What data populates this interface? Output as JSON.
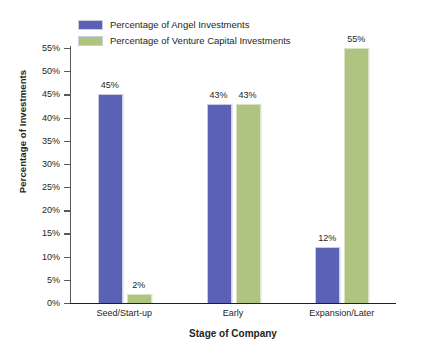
{
  "chart_data": {
    "type": "bar",
    "title": "",
    "xlabel": "Stage of Company",
    "ylabel": "Percentage of Investments",
    "categories": [
      "Seed/Start-up",
      "Early",
      "Expansion/Later"
    ],
    "series": [
      {
        "name": "Percentage of Angel Investments",
        "color": "#5B62B5",
        "values": [
          45,
          43,
          12
        ],
        "labels": [
          "45%",
          "43%",
          "12%"
        ]
      },
      {
        "name": "Percentage of Venture Capital Investments",
        "color": "#AFC480",
        "values": [
          2,
          43,
          55
        ],
        "labels": [
          "2%",
          "43%",
          "55%"
        ]
      }
    ],
    "ylim": [
      0,
      55
    ],
    "ytick_values": [
      0,
      5,
      10,
      15,
      20,
      25,
      30,
      35,
      40,
      45,
      50,
      55
    ],
    "ytick_labels": [
      "0%",
      "5%",
      "10%",
      "15%",
      "20%",
      "25%",
      "30%",
      "35%",
      "40%",
      "45%",
      "50%",
      "55%"
    ],
    "grid": false,
    "legend_position": "top-left"
  },
  "legend": {
    "items": [
      {
        "label": "Percentage of Angel Investments",
        "color": "#5B62B5"
      },
      {
        "label": "Percentage of Venture Capital Investments",
        "color": "#AFC480"
      }
    ]
  }
}
